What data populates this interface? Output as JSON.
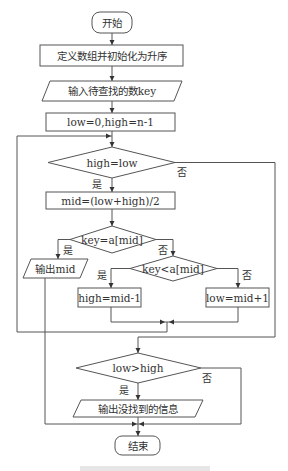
{
  "flowchart": {
    "start": "开始",
    "define_array": "定义数组并初始化为升序",
    "input_key": "输入待查找的数key",
    "init_bounds": "low=0,high=n-1",
    "cond_loop": "high=low",
    "compute_mid": "mid=(low+high)/2",
    "cond_equal": "key=a[mid]",
    "output_mid": "输出mid",
    "cond_less": "key<a[mid]",
    "set_high": "high=mid-1",
    "set_low": "low=mid+1",
    "cond_notfound": "low>high",
    "output_notfound": "输出没找到的信息",
    "end": "结束"
  },
  "branch_labels": {
    "yes": "是",
    "no": "否"
  },
  "colors": {
    "stroke": "#555555",
    "text": "#333333",
    "background": "#ffffff"
  }
}
